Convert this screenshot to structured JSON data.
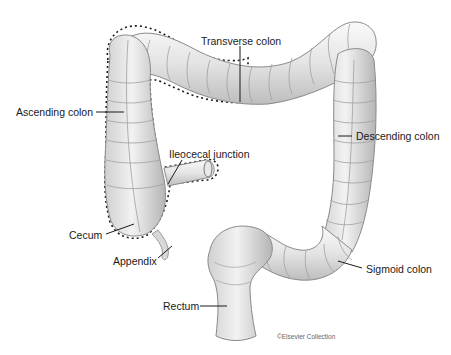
{
  "diagram": {
    "labels": [
      {
        "id": "transverse",
        "text": "Transverse colon"
      },
      {
        "id": "ascending",
        "text": "Ascending colon"
      },
      {
        "id": "ileocecal",
        "text": "Ileocecal junction"
      },
      {
        "id": "descending",
        "text": "Descending colon"
      },
      {
        "id": "cecum",
        "text": "Cecum"
      },
      {
        "id": "appendix",
        "text": "Appendix"
      },
      {
        "id": "sigmoid",
        "text": "Sigmoid colon"
      },
      {
        "id": "rectum",
        "text": "Rectum"
      }
    ],
    "credit": "©Elsevier Collection",
    "colors": {
      "tissue_light": "#f2f2f2",
      "tissue_mid": "#d6d6d6",
      "tissue_dark": "#9a9a9a",
      "leader": "#1a1a1a"
    }
  }
}
